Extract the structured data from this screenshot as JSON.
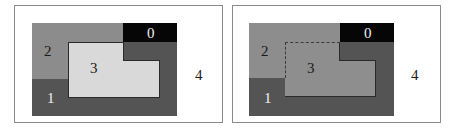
{
  "colors": {
    "region0": "#060606",
    "region1": "#545454",
    "region2": "#8c8c8c",
    "region3_left": "#d9d9d9",
    "region3_right": "#8e8e8e",
    "border": "#2a2a2a",
    "background": "#ffffff"
  },
  "left_panel": {
    "labels": {
      "r0": "0",
      "r1": "1",
      "r2": "2",
      "r3": "3",
      "r4": "4"
    }
  },
  "right_panel": {
    "labels": {
      "r0": "0",
      "r1": "1",
      "r2": "2",
      "r3": "3",
      "r4": "4"
    }
  }
}
